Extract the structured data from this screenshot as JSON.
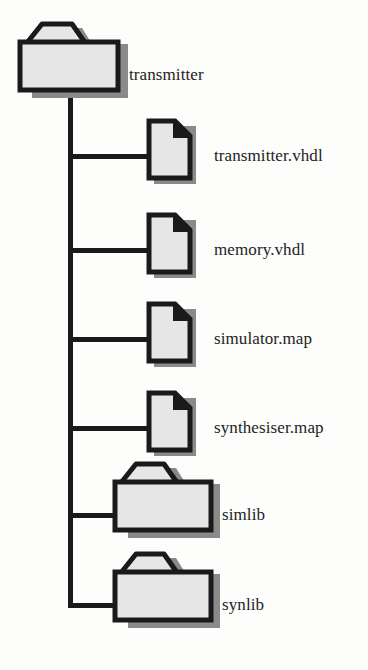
{
  "diagram": {
    "type": "directory-tree",
    "style": {
      "background_color": "#fdfdfc",
      "outline_color": "#1a1a1a",
      "icon_fill_color": "#e6e6e6",
      "shadow_color": "#7d7d7d",
      "label_color": "#232323",
      "line_color": "#1a1a1a"
    },
    "root": {
      "label": "transmitter",
      "icon": "folder-icon",
      "type": "folder"
    },
    "children": [
      {
        "label": "transmitter.vhdl",
        "icon": "file-icon",
        "type": "file"
      },
      {
        "label": "memory.vhdl",
        "icon": "file-icon",
        "type": "file"
      },
      {
        "label": "simulator.map",
        "icon": "file-icon",
        "type": "file"
      },
      {
        "label": "synthesiser.map",
        "icon": "file-icon",
        "type": "file"
      },
      {
        "label": "simlib",
        "icon": "folder-icon",
        "type": "folder"
      },
      {
        "label": "synlib",
        "icon": "folder-icon",
        "type": "folder"
      }
    ]
  }
}
